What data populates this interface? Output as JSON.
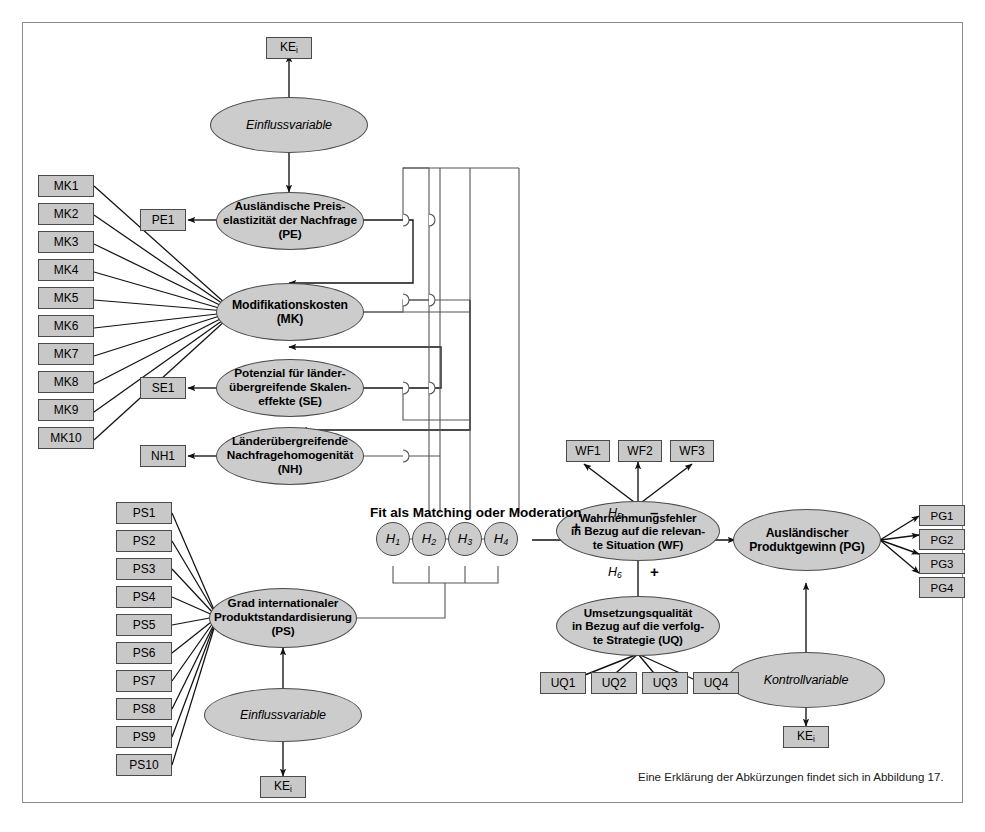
{
  "figure": {
    "caption": "Eine Erklärung der Abkürzungen findet sich in Abbildung 17.",
    "fit_label": "Fit als Matching oder Moderation",
    "colors": {
      "node_fill": "#cccccc",
      "indicator_fill": "#c8c8c8",
      "stroke": "#4a4a4a",
      "frame": "#8a8a8a",
      "background": "#ffffff"
    }
  },
  "constructs": {
    "einfluss_top": "Einflussvariable",
    "pe": "Ausländische Preis-\nelastizität der Nachfrage\n(PE)",
    "pe_l1": "Ausländische Preis-",
    "pe_l2": "elastizität der Nachfrage",
    "pe_l3": "(PE)",
    "mk_l1": "Modifikationskosten",
    "mk_l2": "(MK)",
    "se_l1": "Potenzial für länder-",
    "se_l2": "übergreifende Skalen-",
    "se_l3": "effekte (SE)",
    "nh_l1": "Länderübergreifende",
    "nh_l2": "Nachfragehomogenität",
    "nh_l3": "(NH)",
    "ps_l1": "Grad internationaler",
    "ps_l2": "Produktstandardisierung",
    "ps_l3": "(PS)",
    "einfluss_bottom": "Einflussvariable",
    "wf_l1": "Wahrnehmungsfehler",
    "wf_l2": "in Bezug auf die relevan-",
    "wf_l3": "te Situation (WF)",
    "uq_l1": "Umsetzungsqualität",
    "uq_l2": "in Bezug auf die verfolg-",
    "uq_l3": "te Strategie (UQ)",
    "pg_l1": "Ausländischer",
    "pg_l2": "Produktgewinn (PG)",
    "kontroll": "Kontrollvariable"
  },
  "indicators": {
    "ke_top": "KE",
    "ke_sub": "i",
    "ke_bottom_left": "KE",
    "ke_bottom_right": "KE",
    "pe1": "PE1",
    "se1": "SE1",
    "nh1": "NH1",
    "mk": [
      "MK1",
      "MK2",
      "MK3",
      "MK4",
      "MK5",
      "MK6",
      "MK7",
      "MK8",
      "MK9",
      "MK10"
    ],
    "ps": [
      "PS1",
      "PS2",
      "PS3",
      "PS4",
      "PS5",
      "PS6",
      "PS7",
      "PS8",
      "PS9",
      "PS10"
    ],
    "wf": [
      "WF1",
      "WF2",
      "WF3"
    ],
    "uq": [
      "UQ1",
      "UQ2",
      "UQ3",
      "UQ4"
    ],
    "pg": [
      "PG1",
      "PG2",
      "PG3",
      "PG4"
    ]
  },
  "hypotheses": {
    "circles": [
      "H",
      "H",
      "H",
      "H"
    ],
    "subs": [
      "1",
      "2",
      "3",
      "4"
    ],
    "h1": "H",
    "h1s": "1",
    "h2": "H",
    "h2s": "2",
    "h3": "H",
    "h3s": "3",
    "h4": "H",
    "h4s": "4",
    "h5": "H",
    "h5s": "5",
    "h6": "H",
    "h6s": "6",
    "sign_fit": "+",
    "sign_h5": "–",
    "sign_h6": "+"
  }
}
